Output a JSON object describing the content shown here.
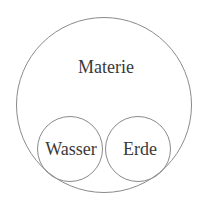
{
  "diagram": {
    "type": "nested-circles",
    "outer": {
      "label": "Materie",
      "cx": 104,
      "cy": 105,
      "r": 88,
      "label_x": 106,
      "label_y": 67
    },
    "inner": [
      {
        "label": "Wasser",
        "cx": 70,
        "cy": 149,
        "r": 33,
        "label_x": 71,
        "label_y": 149
      },
      {
        "label": "Erde",
        "cx": 138,
        "cy": 149,
        "r": 33,
        "label_x": 140,
        "label_y": 149
      }
    ],
    "colors": {
      "stroke": "#8a8a8a",
      "text": "#3a3a3a",
      "background": "#ffffff"
    }
  }
}
